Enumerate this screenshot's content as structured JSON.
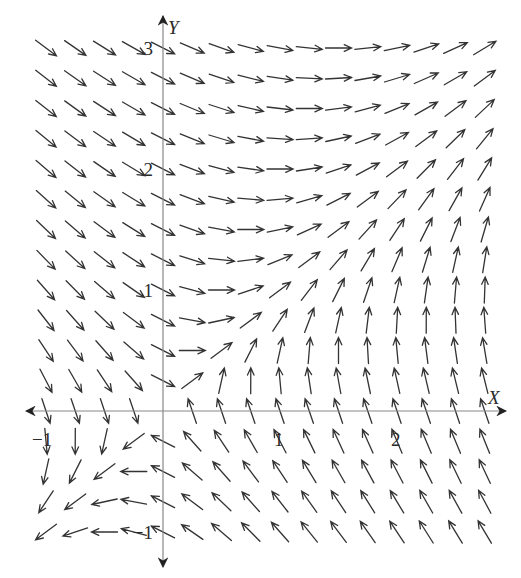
{
  "chart_data": {
    "type": "direction_field",
    "title": "",
    "xlabel": "X",
    "ylabel": "Y",
    "x_ticks": [
      {
        "value": -1,
        "label": "−1"
      },
      {
        "value": 1,
        "label": "1"
      },
      {
        "value": 2,
        "label": "2"
      }
    ],
    "y_ticks": [
      {
        "value": 3,
        "label": "3"
      },
      {
        "value": 2,
        "label": "2"
      },
      {
        "value": 1,
        "label": "1"
      },
      {
        "value": -1,
        "label": "−1"
      }
    ],
    "xlim": [
      -1.15,
      2.95
    ],
    "ylim": [
      -1.3,
      3.25
    ],
    "grid": false,
    "arrow_grid": {
      "x_start": -1,
      "x_end": 2.75,
      "x_step": 0.25,
      "y_start": -1,
      "y_end": 3,
      "y_step": 0.25
    },
    "system": {
      "dx_dt": "y - x/3",
      "dy_dt": "x - y/2",
      "coefficients": {
        "dx_x": -0.333,
        "dx_y": 1,
        "dy_x": 1,
        "dy_y": -0.5
      }
    },
    "arrow_length_px": 26,
    "colors": {
      "arrow": "#333333",
      "axis": "#777777",
      "label": "#2a2a2a"
    }
  }
}
